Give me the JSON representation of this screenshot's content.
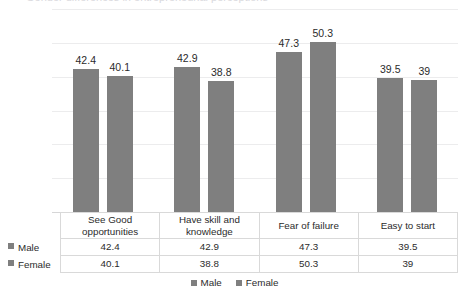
{
  "title_clipped": "Gender differences in entrepreneurial perceptions",
  "chart_data": {
    "type": "bar",
    "title": "",
    "xlabel": "",
    "ylabel": "",
    "ylim": [
      0,
      60
    ],
    "yticks": [
      0,
      10,
      20,
      30,
      40,
      50,
      60
    ],
    "grid": true,
    "legend_position": "bottom",
    "bar_color": "#7f7f7f",
    "categories": [
      "See Good opportunities",
      "Have skill and knowledge",
      "Fear of failure",
      "Easy to start"
    ],
    "series": [
      {
        "name": "Male",
        "values": [
          42.4,
          42.9,
          47.3,
          39.5
        ],
        "labels": [
          "42.4",
          "42.9",
          "47.3",
          "39.5"
        ]
      },
      {
        "name": "Female",
        "values": [
          40.1,
          38.8,
          50.3,
          39.0
        ],
        "labels": [
          "40.1",
          "38.8",
          "50.3",
          "39"
        ]
      }
    ]
  },
  "legend": {
    "items": [
      {
        "label": "Male"
      },
      {
        "label": "Female"
      }
    ]
  }
}
